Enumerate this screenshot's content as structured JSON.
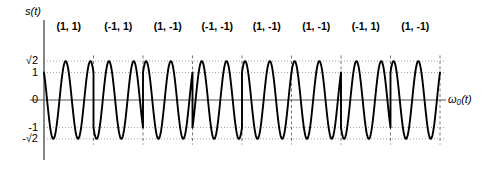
{
  "figure": {
    "title": "QPSK modulated signal waveform s(t)",
    "background_color": "#ffffff",
    "line_color": "#000000",
    "grid_color": "#999999",
    "boundary_color": "#666666"
  },
  "axes": {
    "y_label": "s(t)",
    "x_label": "ω₀(t)",
    "y_ticks": [
      {
        "label": "√2",
        "value": 1.4142
      },
      {
        "label": "1",
        "value": 1
      },
      {
        "label": "0",
        "value": 0
      },
      {
        "label": "-1",
        "value": -1
      },
      {
        "label": "-√2",
        "value": -1.4142
      }
    ],
    "ylim": [
      -1.4142,
      1.4142
    ],
    "grid": true,
    "grid_style": "dotted"
  },
  "symbols": [
    {
      "label": "(1, 1)",
      "i": 1,
      "q": 1
    },
    {
      "label": "(-1, 1)",
      "i": -1,
      "q": 1
    },
    {
      "label": "(1, -1)",
      "i": 1,
      "q": -1
    },
    {
      "label": "(-1, -1)",
      "i": -1,
      "q": -1
    },
    {
      "label": "(1, -1)",
      "i": 1,
      "q": -1
    },
    {
      "label": "(1, -1)",
      "i": 1,
      "q": -1
    },
    {
      "label": "(-1, 1)",
      "i": -1,
      "q": 1
    },
    {
      "label": "(1, -1)",
      "i": 1,
      "q": -1
    }
  ],
  "chart_data": {
    "type": "line",
    "title": "",
    "xlabel": "ω₀(t)",
    "ylabel": "s(t)",
    "ylim": [
      -1.4142,
      1.4142
    ],
    "xlim": [
      0,
      8
    ],
    "grid": true,
    "legend": false,
    "amplitude": 1.4142,
    "cycles_per_symbol": 2,
    "symbol_count": 8,
    "series": [
      {
        "name": "s(t)",
        "description": "QPSK carrier; amplitude sqrt(2), phase set by symbol (I,Q)",
        "symbol_phases_deg": [
          45,
          135,
          315,
          225,
          315,
          315,
          135,
          315
        ]
      }
    ],
    "categories": [
      "(1, 1)",
      "(-1, 1)",
      "(1, -1)",
      "(-1, -1)",
      "(1, -1)",
      "(1, -1)",
      "(-1, 1)",
      "(1, -1)"
    ],
    "values": [
      45,
      135,
      315,
      225,
      315,
      315,
      135,
      315
    ]
  },
  "geometry": {
    "origin_x": 44,
    "origin_y": 100,
    "plot_right": 440,
    "symbol_width": 49.5,
    "y_top": 20,
    "y_bottom": 160,
    "unit_px": 27.5
  }
}
